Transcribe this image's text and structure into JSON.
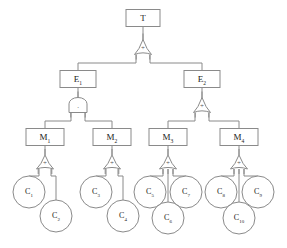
{
  "diagram": {
    "type": "fault-tree",
    "canvas": {
      "width": 287,
      "height": 248
    },
    "colors": {
      "background": "#ffffff",
      "stroke": "#8a8a8a",
      "text": "#1a1a1a",
      "gate_symbol": "#555555"
    },
    "gate_symbols": {
      "or": "+",
      "and": "."
    },
    "nodes": [
      {
        "id": "T",
        "label": "T",
        "sub": "",
        "kind": "box",
        "x": 143,
        "y": 18,
        "w": 34,
        "h": 17,
        "font": 9
      },
      {
        "id": "E1",
        "label": "E",
        "sub": "1",
        "kind": "box",
        "x": 78,
        "y": 79,
        "w": 36,
        "h": 17,
        "font": 9
      },
      {
        "id": "E2",
        "label": "E",
        "sub": "2",
        "kind": "box",
        "x": 202,
        "y": 79,
        "w": 36,
        "h": 17,
        "font": 9
      },
      {
        "id": "M1",
        "label": "M",
        "sub": "1",
        "kind": "box",
        "x": 45,
        "y": 137,
        "w": 38,
        "h": 17,
        "font": 9
      },
      {
        "id": "M2",
        "label": "M",
        "sub": "2",
        "kind": "box",
        "x": 112,
        "y": 137,
        "w": 38,
        "h": 17,
        "font": 9
      },
      {
        "id": "M3",
        "label": "M",
        "sub": "3",
        "kind": "box",
        "x": 168,
        "y": 137,
        "w": 38,
        "h": 17,
        "font": 9
      },
      {
        "id": "M4",
        "label": "M",
        "sub": "4",
        "kind": "box",
        "x": 239,
        "y": 137,
        "w": 38,
        "h": 17,
        "font": 9
      },
      {
        "id": "C1",
        "label": "C",
        "sub": "1",
        "kind": "circle",
        "x": 29,
        "y": 192,
        "r": 16,
        "font": 8
      },
      {
        "id": "C2",
        "label": "C",
        "sub": "2",
        "kind": "circle",
        "x": 56,
        "y": 216,
        "r": 16,
        "font": 8
      },
      {
        "id": "C3",
        "label": "C",
        "sub": "3",
        "kind": "circle",
        "x": 96,
        "y": 192,
        "r": 16,
        "font": 8
      },
      {
        "id": "C4",
        "label": "C",
        "sub": "4",
        "kind": "circle",
        "x": 123,
        "y": 216,
        "r": 16,
        "font": 8
      },
      {
        "id": "C5",
        "label": "C",
        "sub": "5",
        "kind": "circle",
        "x": 150,
        "y": 192,
        "r": 16,
        "font": 8
      },
      {
        "id": "C7",
        "label": "C",
        "sub": "7",
        "kind": "circle",
        "x": 186,
        "y": 192,
        "r": 16,
        "font": 8
      },
      {
        "id": "C6",
        "label": "C",
        "sub": "6",
        "kind": "circle",
        "x": 168,
        "y": 218,
        "r": 16,
        "font": 8
      },
      {
        "id": "C8",
        "label": "C",
        "sub": "8",
        "kind": "circle",
        "x": 221,
        "y": 192,
        "r": 16,
        "font": 8
      },
      {
        "id": "C9",
        "label": "C",
        "sub": "9",
        "kind": "circle",
        "x": 258,
        "y": 192,
        "r": 16,
        "font": 8
      },
      {
        "id": "C10",
        "label": "C",
        "sub": "10",
        "kind": "circle",
        "x": 239,
        "y": 218,
        "r": 16,
        "font": 8
      }
    ],
    "gates": [
      {
        "id": "G-T",
        "type": "or",
        "symbol": "+",
        "x": 143,
        "y": 47,
        "w": 17,
        "h": 15,
        "parent": "T",
        "children": [
          "E1",
          "E2"
        ]
      },
      {
        "id": "G-E1",
        "type": "and",
        "symbol": ".",
        "x": 78,
        "y": 105,
        "w": 18,
        "h": 15,
        "parent": "E1",
        "children": [
          "M1",
          "M2"
        ]
      },
      {
        "id": "G-E2",
        "type": "or",
        "symbol": "+",
        "x": 202,
        "y": 105,
        "w": 17,
        "h": 15,
        "parent": "E2",
        "children": [
          "M3",
          "M4"
        ]
      },
      {
        "id": "G-M1",
        "type": "or",
        "symbol": "+",
        "x": 45,
        "y": 162,
        "w": 17,
        "h": 14,
        "parent": "M1",
        "children": [
          "C1",
          "C2"
        ]
      },
      {
        "id": "G-M2",
        "type": "or",
        "symbol": "+",
        "x": 112,
        "y": 162,
        "w": 17,
        "h": 14,
        "parent": "M2",
        "children": [
          "C3",
          "C4"
        ]
      },
      {
        "id": "G-M3",
        "type": "or",
        "symbol": "+",
        "x": 168,
        "y": 162,
        "w": 17,
        "h": 14,
        "parent": "M3",
        "children": [
          "C5",
          "C6",
          "C7"
        ]
      },
      {
        "id": "G-M4",
        "type": "or",
        "symbol": "+",
        "x": 239,
        "y": 162,
        "w": 17,
        "h": 14,
        "parent": "M4",
        "children": [
          "C8",
          "C10",
          "C9"
        ]
      }
    ],
    "edges": [
      {
        "id": "e-T-gate",
        "from": "T",
        "to": "G-T",
        "points": [
          [
            143,
            27
          ],
          [
            143,
            40
          ]
        ]
      },
      {
        "id": "e-gate-E1",
        "from": "G-T",
        "to": "E1",
        "points": [
          [
            136,
            55
          ],
          [
            136,
            63
          ],
          [
            78,
            63
          ],
          [
            78,
            71
          ]
        ]
      },
      {
        "id": "e-gate-E2",
        "from": "G-T",
        "to": "E2",
        "points": [
          [
            150,
            55
          ],
          [
            150,
            63
          ],
          [
            202,
            63
          ],
          [
            202,
            71
          ]
        ]
      },
      {
        "id": "e-E1-gate",
        "from": "E1",
        "to": "G-E1",
        "points": [
          [
            78,
            88
          ],
          [
            78,
            98
          ]
        ]
      },
      {
        "id": "e-gE1-M1",
        "from": "G-E1",
        "to": "M1",
        "points": [
          [
            71,
            113
          ],
          [
            71,
            121
          ],
          [
            45,
            121
          ],
          [
            45,
            129
          ]
        ]
      },
      {
        "id": "e-gE1-M2",
        "from": "G-E1",
        "to": "M2",
        "points": [
          [
            85,
            113
          ],
          [
            85,
            121
          ],
          [
            112,
            121
          ],
          [
            112,
            129
          ]
        ]
      },
      {
        "id": "e-E2-gate",
        "from": "E2",
        "to": "G-E2",
        "points": [
          [
            202,
            88
          ],
          [
            202,
            98
          ]
        ]
      },
      {
        "id": "e-gE2-M3",
        "from": "G-E2",
        "to": "M3",
        "points": [
          [
            195,
            113
          ],
          [
            195,
            121
          ],
          [
            168,
            121
          ],
          [
            168,
            129
          ]
        ]
      },
      {
        "id": "e-gE2-M4",
        "from": "G-E2",
        "to": "M4",
        "points": [
          [
            209,
            113
          ],
          [
            209,
            121
          ],
          [
            239,
            121
          ],
          [
            239,
            129
          ]
        ]
      },
      {
        "id": "e-M1-gate",
        "from": "M1",
        "to": "G-M1",
        "points": [
          [
            45,
            146
          ],
          [
            45,
            155
          ]
        ]
      },
      {
        "id": "e-gM1-C1",
        "from": "G-M1",
        "to": "C1",
        "points": [
          [
            39,
            169
          ],
          [
            39,
            176
          ],
          [
            29,
            176
          ],
          [
            29,
            180
          ]
        ]
      },
      {
        "id": "e-gM1-C2",
        "from": "G-M1",
        "to": "C2",
        "points": [
          [
            51,
            169
          ],
          [
            51,
            176
          ],
          [
            56,
            176
          ],
          [
            56,
            204
          ]
        ]
      },
      {
        "id": "e-M2-gate",
        "from": "M2",
        "to": "G-M2",
        "points": [
          [
            112,
            146
          ],
          [
            112,
            155
          ]
        ]
      },
      {
        "id": "e-gM2-C3",
        "from": "G-M2",
        "to": "C3",
        "points": [
          [
            106,
            169
          ],
          [
            106,
            176
          ],
          [
            96,
            176
          ],
          [
            96,
            180
          ]
        ]
      },
      {
        "id": "e-gM2-C4",
        "from": "G-M2",
        "to": "C4",
        "points": [
          [
            118,
            169
          ],
          [
            118,
            176
          ],
          [
            123,
            176
          ],
          [
            123,
            204
          ]
        ]
      },
      {
        "id": "e-M3-gate",
        "from": "M3",
        "to": "G-M3",
        "points": [
          [
            168,
            146
          ],
          [
            168,
            155
          ]
        ]
      },
      {
        "id": "e-gM3-C5",
        "from": "G-M3",
        "to": "C5",
        "points": [
          [
            163,
            169
          ],
          [
            163,
            176
          ],
          [
            150,
            176
          ],
          [
            150,
            180
          ]
        ]
      },
      {
        "id": "e-gM3-C6",
        "from": "G-M3",
        "to": "C6",
        "points": [
          [
            168,
            169
          ],
          [
            168,
            206
          ]
        ]
      },
      {
        "id": "e-gM3-C7",
        "from": "G-M3",
        "to": "C7",
        "points": [
          [
            173,
            169
          ],
          [
            173,
            176
          ],
          [
            186,
            176
          ],
          [
            186,
            180
          ]
        ]
      },
      {
        "id": "e-M4-gate",
        "from": "M4",
        "to": "G-M4",
        "points": [
          [
            239,
            146
          ],
          [
            239,
            155
          ]
        ]
      },
      {
        "id": "e-gM4-C8",
        "from": "G-M4",
        "to": "C8",
        "points": [
          [
            234,
            169
          ],
          [
            234,
            176
          ],
          [
            221,
            176
          ],
          [
            221,
            180
          ]
        ]
      },
      {
        "id": "e-gM4-C10",
        "from": "G-M4",
        "to": "C10",
        "points": [
          [
            239,
            169
          ],
          [
            239,
            206
          ]
        ]
      },
      {
        "id": "e-gM4-C9",
        "from": "G-M4",
        "to": "C9",
        "points": [
          [
            244,
            169
          ],
          [
            244,
            176
          ],
          [
            258,
            176
          ],
          [
            258,
            180
          ]
        ]
      }
    ]
  }
}
